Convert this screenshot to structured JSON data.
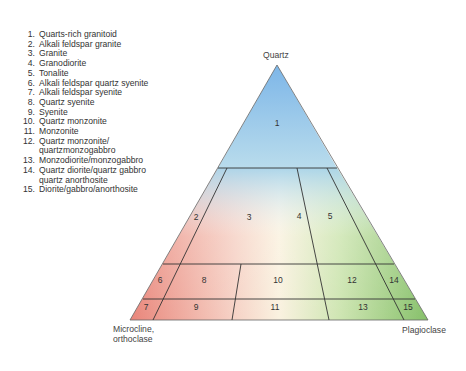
{
  "legend": {
    "items": [
      {
        "num": "1.",
        "label": "Quarts-rich granitoid"
      },
      {
        "num": "2.",
        "label": "Alkali feldspar granite"
      },
      {
        "num": "3.",
        "label": "Granite"
      },
      {
        "num": "4.",
        "label": "Granodiorite"
      },
      {
        "num": "5.",
        "label": "Tonalite"
      },
      {
        "num": "6.",
        "label": "Alkali feldspar quartz syenite"
      },
      {
        "num": "7.",
        "label": "Alkali feldspar syenite"
      },
      {
        "num": "8.",
        "label": "Quartz syenite"
      },
      {
        "num": "9.",
        "label": "Syenite"
      },
      {
        "num": "10.",
        "label": "Quartz monzonite"
      },
      {
        "num": "11.",
        "label": "Monzonite"
      },
      {
        "num": "12.",
        "label": "Quartz monzonite/\nquartzmonzogabbro"
      },
      {
        "num": "13.",
        "label": "Monzodiorite/monzogabbro"
      },
      {
        "num": "14.",
        "label": "Quartz diorite/quartz gabbro\nquartz anorthosite"
      },
      {
        "num": "15.",
        "label": "Diorite/gabbro/anorthosite"
      }
    ]
  },
  "diagram": {
    "apex_label": "Quartz",
    "bottom_left_label": "Microcline,\northoclase",
    "bottom_right_label": "Plagioclase",
    "colors": {
      "quartz": "#7fb8e6",
      "alkali_feldspar": "#e88a7c",
      "plagioclase": "#8cc46e",
      "center": "#fbf3e2",
      "line": "#333333"
    },
    "regions": {
      "r1": "1",
      "r2": "2",
      "r3": "3",
      "r4": "4",
      "r5": "5",
      "r6": "6",
      "r7": "7",
      "r8": "8",
      "r9": "9",
      "r10": "10",
      "r11": "11",
      "r12": "12",
      "r13": "13",
      "r14": "14",
      "r15": "15"
    }
  }
}
